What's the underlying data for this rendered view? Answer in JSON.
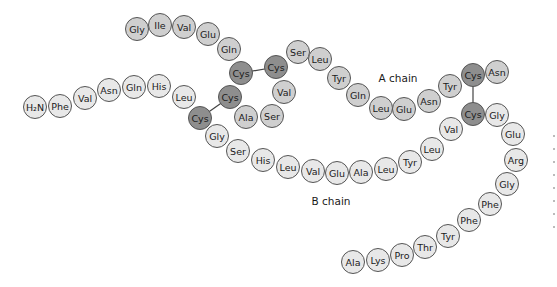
{
  "labels": {
    "a_chain": "A chain",
    "b_chain": "B chain"
  },
  "colors": {
    "a_chain_fill": "#cfcfcf",
    "b_chain_fill": "#e8e8e8",
    "cys_fill": "#8e8e8e",
    "stroke": "#555555",
    "bond": "#444444"
  },
  "radius": 11.5,
  "a_chain": [
    {
      "label": "Gly",
      "x": 137,
      "y": 29
    },
    {
      "label": "Ile",
      "x": 160,
      "y": 25
    },
    {
      "label": "Val",
      "x": 184,
      "y": 27
    },
    {
      "label": "Glu",
      "x": 208,
      "y": 34
    },
    {
      "label": "Gln",
      "x": 229,
      "y": 49
    },
    {
      "label": "Cys",
      "x": 241,
      "y": 73,
      "cys": true
    },
    {
      "label": "Cys",
      "x": 276,
      "y": 67,
      "cys": true
    },
    {
      "label": "Val",
      "x": 284,
      "y": 92
    },
    {
      "label": "Ser",
      "x": 272,
      "y": 116
    },
    {
      "label": "Ala",
      "x": 246,
      "y": 117
    },
    {
      "label": "Cys",
      "x": 230,
      "y": 97,
      "cys": true
    },
    {
      "label": "Ser",
      "x": 298,
      "y": 52
    },
    {
      "label": "Leu",
      "x": 320,
      "y": 59
    },
    {
      "label": "Tyr",
      "x": 339,
      "y": 78
    },
    {
      "label": "Gln",
      "x": 358,
      "y": 95
    },
    {
      "label": "Leu",
      "x": 381,
      "y": 108
    },
    {
      "label": "Glu",
      "x": 404,
      "y": 109
    },
    {
      "label": "Asn",
      "x": 429,
      "y": 101
    },
    {
      "label": "Tyr",
      "x": 450,
      "y": 86
    },
    {
      "label": "Cys",
      "x": 473,
      "y": 75,
      "cys": true
    },
    {
      "label": "Asn",
      "x": 497,
      "y": 72
    }
  ],
  "b_chain": [
    {
      "label": "H₂N",
      "x": 35,
      "y": 107
    },
    {
      "label": "Phe",
      "x": 60,
      "y": 106
    },
    {
      "label": "Val",
      "x": 85,
      "y": 98
    },
    {
      "label": "Asn",
      "x": 109,
      "y": 90
    },
    {
      "label": "Gln",
      "x": 134,
      "y": 87
    },
    {
      "label": "His",
      "x": 159,
      "y": 86
    },
    {
      "label": "Leu",
      "x": 184,
      "y": 97
    },
    {
      "label": "Cys",
      "x": 200,
      "y": 118,
      "cys": true
    },
    {
      "label": "Gly",
      "x": 217,
      "y": 136
    },
    {
      "label": "Ser",
      "x": 238,
      "y": 151
    },
    {
      "label": "His",
      "x": 263,
      "y": 160
    },
    {
      "label": "Leu",
      "x": 288,
      "y": 167
    },
    {
      "label": "Val",
      "x": 313,
      "y": 171
    },
    {
      "label": "Glu",
      "x": 337,
      "y": 173
    },
    {
      "label": "Ala",
      "x": 361,
      "y": 172
    },
    {
      "label": "Leu",
      "x": 386,
      "y": 169
    },
    {
      "label": "Tyr",
      "x": 410,
      "y": 162
    },
    {
      "label": "Leu",
      "x": 432,
      "y": 149
    },
    {
      "label": "Val",
      "x": 451,
      "y": 129
    },
    {
      "label": "Cys",
      "x": 473,
      "y": 114,
      "cys": true
    },
    {
      "label": "Gly",
      "x": 497,
      "y": 115
    },
    {
      "label": "Glu",
      "x": 513,
      "y": 134
    },
    {
      "label": "Arg",
      "x": 516,
      "y": 160
    },
    {
      "label": "Gly",
      "x": 507,
      "y": 184
    },
    {
      "label": "Phe",
      "x": 490,
      "y": 204
    },
    {
      "label": "Phe",
      "x": 469,
      "y": 220
    },
    {
      "label": "Tyr",
      "x": 448,
      "y": 236
    },
    {
      "label": "Thr",
      "x": 425,
      "y": 247
    },
    {
      "label": "Pro",
      "x": 402,
      "y": 255
    },
    {
      "label": "Lys",
      "x": 378,
      "y": 260
    },
    {
      "label": "Ala",
      "x": 353,
      "y": 262
    }
  ],
  "disulfide_bonds": [
    {
      "from": [
        241,
        73
      ],
      "to": [
        276,
        67
      ]
    },
    {
      "from": [
        230,
        97
      ],
      "to": [
        200,
        118
      ]
    },
    {
      "from": [
        473,
        75
      ],
      "to": [
        473,
        114
      ]
    }
  ],
  "label_positions": {
    "a_chain": {
      "x": 398,
      "y": 82
    },
    "b_chain": {
      "x": 331,
      "y": 205
    }
  }
}
